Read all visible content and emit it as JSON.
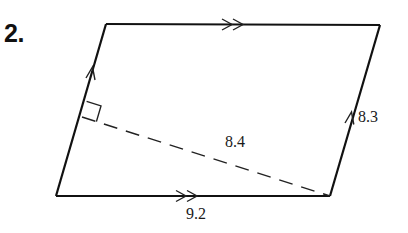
{
  "problem": {
    "number": "2."
  },
  "shape": {
    "type": "parallelogram",
    "vertices": {
      "top_left": [
        106,
        24
      ],
      "top_right": [
        380,
        25
      ],
      "bottom_right": [
        330,
        196
      ],
      "bottom_left": [
        56,
        196
      ]
    },
    "stroke_color": "#111111"
  },
  "labels": {
    "side": "8.3",
    "height": "8.4",
    "base": "9.2"
  },
  "marks": {
    "top_side": "double-arrow",
    "bottom_side": "double-arrow",
    "left_side": "single-arrow",
    "right_side": "single-arrow",
    "right_angle": "at foot of height on left side"
  }
}
